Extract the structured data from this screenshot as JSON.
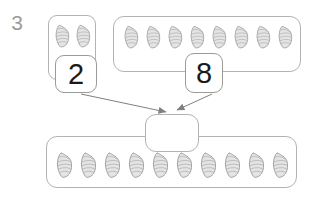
{
  "question": {
    "number": "3"
  },
  "problem": {
    "addend1": {
      "value": "2",
      "shell_count": 2
    },
    "addend2": {
      "value": "8",
      "shell_count": 8
    },
    "sum": {
      "value": "",
      "shell_count": 10
    }
  },
  "icons": {
    "item": "seashell-icon"
  },
  "colors": {
    "question_number": "#9b9b9b",
    "box_border": "#b3b3b3",
    "number_box_border": "#9a9a9a",
    "number_text": "#1b1b1b",
    "arrow": "#808080",
    "shell_fill": "#e4e4e4",
    "shell_stroke": "#979797",
    "shell_stripe": "#ababab"
  }
}
